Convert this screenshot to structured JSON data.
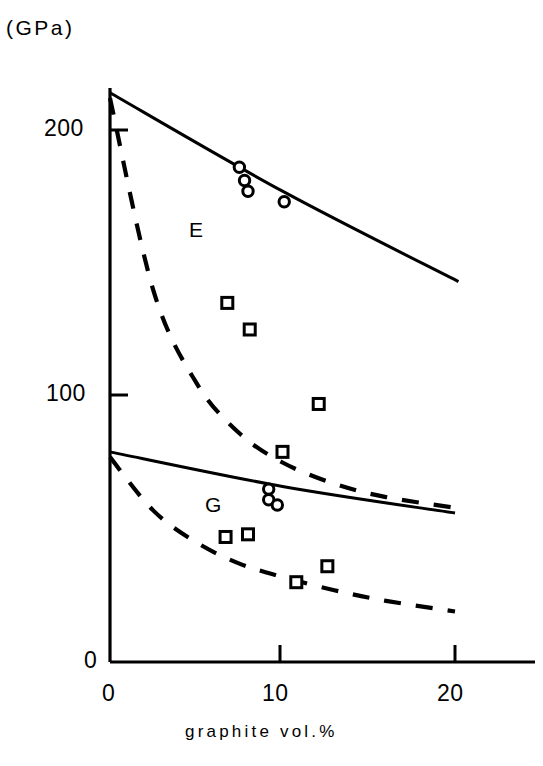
{
  "figure": {
    "background_color": "#ffffff",
    "ink_color": "#000000",
    "unit_label": "(GPa)"
  },
  "axes": {
    "x": {
      "label": "graphite  vol.%",
      "ticks": [
        {
          "value": 0,
          "label": "0",
          "px": 110
        },
        {
          "value": 10,
          "label": "10",
          "px": 280
        },
        {
          "value": 20,
          "label": "20",
          "px": 455
        }
      ],
      "range": [
        0,
        22
      ]
    },
    "y": {
      "label": "(GPa)",
      "ticks": [
        {
          "value": 0,
          "label": "0",
          "px": 662
        },
        {
          "value": 100,
          "label": "100",
          "px": 395
        },
        {
          "value": 200,
          "label": "200",
          "px": 130
        }
      ],
      "range": [
        0,
        217
      ]
    }
  },
  "annotations": [
    {
      "text": "E",
      "x": 5.1,
      "y": 165
    },
    {
      "text": "G",
      "x": 6.1,
      "y": 62
    }
  ],
  "chart_data": {
    "type": "scatter",
    "title": "",
    "subtitle": "",
    "xlabel": "graphite  vol.%",
    "ylabel": "(GPa)",
    "xlim": [
      0,
      22
    ],
    "ylim": [
      0,
      217
    ],
    "grid": false,
    "legend": "none",
    "xticks": [
      0,
      10,
      20
    ],
    "yticks": [
      0,
      100,
      200
    ],
    "annotations": [
      {
        "text": "E",
        "x": 5.1,
        "y": 165,
        "note": "Young's modulus region"
      },
      {
        "text": "G",
        "x": 6.1,
        "y": 62,
        "note": "Shear modulus region"
      }
    ],
    "series": [
      {
        "name": "E circles",
        "property": "E",
        "marker": "open-circle",
        "type": "scatter",
        "points": [
          {
            "x": 7.5,
            "y": 186
          },
          {
            "x": 7.8,
            "y": 181
          },
          {
            "x": 8.0,
            "y": 177
          },
          {
            "x": 10.1,
            "y": 173
          }
        ]
      },
      {
        "name": "E squares",
        "property": "E",
        "marker": "open-square",
        "type": "scatter",
        "points": [
          {
            "x": 6.8,
            "y": 135
          },
          {
            "x": 8.1,
            "y": 125
          },
          {
            "x": 12.1,
            "y": 97
          },
          {
            "x": 10.0,
            "y": 79
          }
        ]
      },
      {
        "name": "G circles",
        "property": "G",
        "marker": "open-circle",
        "type": "scatter",
        "points": [
          {
            "x": 9.2,
            "y": 65
          },
          {
            "x": 9.2,
            "y": 61
          },
          {
            "x": 9.7,
            "y": 59
          }
        ]
      },
      {
        "name": "G squares",
        "property": "G",
        "marker": "open-square",
        "type": "scatter",
        "points": [
          {
            "x": 6.7,
            "y": 47
          },
          {
            "x": 8.0,
            "y": 48
          },
          {
            "x": 12.6,
            "y": 36
          },
          {
            "x": 10.8,
            "y": 30
          }
        ]
      },
      {
        "name": "E upper bound",
        "property": "E",
        "type": "line",
        "style": "solid",
        "points": [
          {
            "x": 0,
            "y": 214
          },
          {
            "x": 10,
            "y": 177
          },
          {
            "x": 20.2,
            "y": 143
          }
        ]
      },
      {
        "name": "E lower bound",
        "property": "E",
        "type": "line",
        "style": "dashed",
        "points": [
          {
            "x": 0,
            "y": 212
          },
          {
            "x": 2.5,
            "y": 140
          },
          {
            "x": 5,
            "y": 105
          },
          {
            "x": 7.5,
            "y": 86
          },
          {
            "x": 10,
            "y": 75
          },
          {
            "x": 13,
            "y": 67
          },
          {
            "x": 16,
            "y": 62
          },
          {
            "x": 20,
            "y": 58
          }
        ]
      },
      {
        "name": "G upper bound",
        "property": "G",
        "type": "line",
        "style": "solid",
        "points": [
          {
            "x": 0,
            "y": 79
          },
          {
            "x": 10,
            "y": 66
          },
          {
            "x": 20,
            "y": 56
          }
        ]
      },
      {
        "name": "G lower bound",
        "property": "G",
        "type": "line",
        "style": "dashed",
        "points": [
          {
            "x": 0,
            "y": 77
          },
          {
            "x": 2.5,
            "y": 57
          },
          {
            "x": 5,
            "y": 45
          },
          {
            "x": 7.5,
            "y": 37
          },
          {
            "x": 10,
            "y": 32
          },
          {
            "x": 13,
            "y": 27
          },
          {
            "x": 16,
            "y": 23
          },
          {
            "x": 20,
            "y": 19
          }
        ]
      }
    ]
  }
}
